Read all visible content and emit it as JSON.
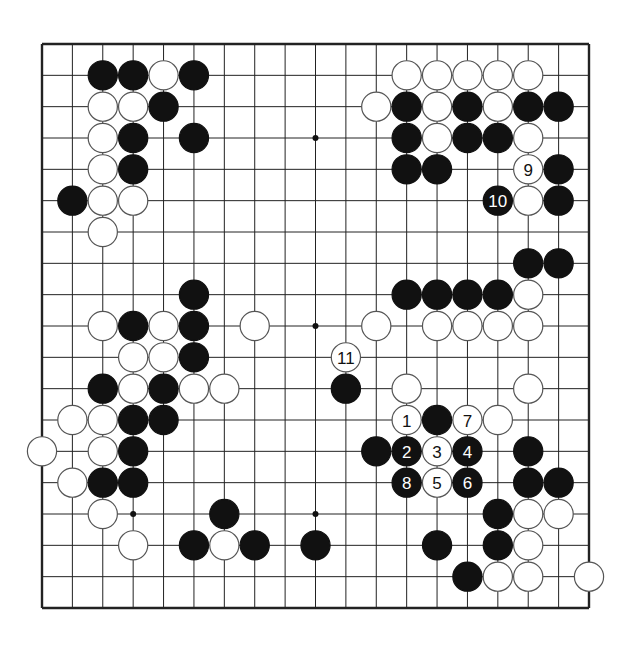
{
  "diagram": {
    "type": "go-board",
    "size": 19,
    "colors": {
      "line": "#222222",
      "black": "#111111",
      "white": "#ffffff",
      "background": "#ffffff"
    },
    "star_points": [
      [
        3,
        3
      ],
      [
        9,
        3
      ],
      [
        15,
        3
      ],
      [
        3,
        9
      ],
      [
        9,
        9
      ],
      [
        15,
        9
      ],
      [
        3,
        15
      ],
      [
        9,
        15
      ],
      [
        15,
        15
      ]
    ],
    "stones": [
      {
        "c": "B",
        "x": 2,
        "y": 1
      },
      {
        "c": "B",
        "x": 3,
        "y": 1
      },
      {
        "c": "W",
        "x": 4,
        "y": 1
      },
      {
        "c": "B",
        "x": 5,
        "y": 1
      },
      {
        "c": "W",
        "x": 2,
        "y": 2
      },
      {
        "c": "W",
        "x": 3,
        "y": 2
      },
      {
        "c": "B",
        "x": 4,
        "y": 2
      },
      {
        "c": "W",
        "x": 2,
        "y": 3
      },
      {
        "c": "B",
        "x": 3,
        "y": 3
      },
      {
        "c": "B",
        "x": 5,
        "y": 3
      },
      {
        "c": "W",
        "x": 2,
        "y": 4
      },
      {
        "c": "B",
        "x": 3,
        "y": 4
      },
      {
        "c": "B",
        "x": 1,
        "y": 5
      },
      {
        "c": "W",
        "x": 2,
        "y": 5
      },
      {
        "c": "W",
        "x": 3,
        "y": 5
      },
      {
        "c": "W",
        "x": 2,
        "y": 6
      },
      {
        "c": "W",
        "x": 12,
        "y": 1
      },
      {
        "c": "W",
        "x": 13,
        "y": 1
      },
      {
        "c": "W",
        "x": 14,
        "y": 1
      },
      {
        "c": "W",
        "x": 15,
        "y": 1
      },
      {
        "c": "W",
        "x": 16,
        "y": 1
      },
      {
        "c": "W",
        "x": 11,
        "y": 2
      },
      {
        "c": "B",
        "x": 12,
        "y": 2
      },
      {
        "c": "W",
        "x": 13,
        "y": 2
      },
      {
        "c": "B",
        "x": 14,
        "y": 2
      },
      {
        "c": "W",
        "x": 15,
        "y": 2
      },
      {
        "c": "B",
        "x": 16,
        "y": 2
      },
      {
        "c": "B",
        "x": 17,
        "y": 2
      },
      {
        "c": "B",
        "x": 12,
        "y": 3
      },
      {
        "c": "W",
        "x": 13,
        "y": 3
      },
      {
        "c": "B",
        "x": 14,
        "y": 3
      },
      {
        "c": "B",
        "x": 15,
        "y": 3
      },
      {
        "c": "W",
        "x": 16,
        "y": 3
      },
      {
        "c": "B",
        "x": 12,
        "y": 4
      },
      {
        "c": "B",
        "x": 13,
        "y": 4
      },
      {
        "c": "W",
        "x": 16,
        "y": 4,
        "n": "9"
      },
      {
        "c": "B",
        "x": 17,
        "y": 4
      },
      {
        "c": "B",
        "x": 15,
        "y": 5,
        "n": "10"
      },
      {
        "c": "W",
        "x": 16,
        "y": 5
      },
      {
        "c": "B",
        "x": 17,
        "y": 5
      },
      {
        "c": "B",
        "x": 16,
        "y": 7
      },
      {
        "c": "B",
        "x": 17,
        "y": 7
      },
      {
        "c": "B",
        "x": 5,
        "y": 8
      },
      {
        "c": "B",
        "x": 12,
        "y": 8
      },
      {
        "c": "B",
        "x": 13,
        "y": 8
      },
      {
        "c": "B",
        "x": 14,
        "y": 8
      },
      {
        "c": "B",
        "x": 15,
        "y": 8
      },
      {
        "c": "W",
        "x": 16,
        "y": 8
      },
      {
        "c": "W",
        "x": 2,
        "y": 9
      },
      {
        "c": "B",
        "x": 3,
        "y": 9
      },
      {
        "c": "W",
        "x": 4,
        "y": 9
      },
      {
        "c": "B",
        "x": 5,
        "y": 9
      },
      {
        "c": "W",
        "x": 7,
        "y": 9
      },
      {
        "c": "W",
        "x": 11,
        "y": 9
      },
      {
        "c": "W",
        "x": 13,
        "y": 9
      },
      {
        "c": "W",
        "x": 14,
        "y": 9
      },
      {
        "c": "W",
        "x": 15,
        "y": 9
      },
      {
        "c": "W",
        "x": 16,
        "y": 9
      },
      {
        "c": "W",
        "x": 3,
        "y": 10
      },
      {
        "c": "W",
        "x": 4,
        "y": 10
      },
      {
        "c": "B",
        "x": 5,
        "y": 10
      },
      {
        "c": "W",
        "x": 10,
        "y": 10,
        "n": "11"
      },
      {
        "c": "B",
        "x": 2,
        "y": 11
      },
      {
        "c": "W",
        "x": 3,
        "y": 11
      },
      {
        "c": "B",
        "x": 4,
        "y": 11
      },
      {
        "c": "W",
        "x": 5,
        "y": 11
      },
      {
        "c": "W",
        "x": 6,
        "y": 11
      },
      {
        "c": "B",
        "x": 10,
        "y": 11
      },
      {
        "c": "W",
        "x": 12,
        "y": 11
      },
      {
        "c": "W",
        "x": 16,
        "y": 11
      },
      {
        "c": "W",
        "x": 1,
        "y": 12
      },
      {
        "c": "W",
        "x": 2,
        "y": 12
      },
      {
        "c": "B",
        "x": 3,
        "y": 12
      },
      {
        "c": "B",
        "x": 4,
        "y": 12
      },
      {
        "c": "W",
        "x": 12,
        "y": 12,
        "n": "1"
      },
      {
        "c": "B",
        "x": 13,
        "y": 12
      },
      {
        "c": "W",
        "x": 14,
        "y": 12,
        "n": "7"
      },
      {
        "c": "W",
        "x": 15,
        "y": 12
      },
      {
        "c": "W",
        "x": 0,
        "y": 13
      },
      {
        "c": "W",
        "x": 2,
        "y": 13
      },
      {
        "c": "B",
        "x": 3,
        "y": 13
      },
      {
        "c": "B",
        "x": 11,
        "y": 13
      },
      {
        "c": "B",
        "x": 12,
        "y": 13,
        "n": "2"
      },
      {
        "c": "W",
        "x": 13,
        "y": 13,
        "n": "3"
      },
      {
        "c": "B",
        "x": 14,
        "y": 13,
        "n": "4"
      },
      {
        "c": "B",
        "x": 16,
        "y": 13
      },
      {
        "c": "W",
        "x": 1,
        "y": 14
      },
      {
        "c": "B",
        "x": 2,
        "y": 14
      },
      {
        "c": "B",
        "x": 3,
        "y": 14
      },
      {
        "c": "B",
        "x": 12,
        "y": 14,
        "n": "8"
      },
      {
        "c": "W",
        "x": 13,
        "y": 14,
        "n": "5"
      },
      {
        "c": "B",
        "x": 14,
        "y": 14,
        "n": "6"
      },
      {
        "c": "B",
        "x": 16,
        "y": 14
      },
      {
        "c": "B",
        "x": 17,
        "y": 14
      },
      {
        "c": "W",
        "x": 2,
        "y": 15
      },
      {
        "c": "B",
        "x": 6,
        "y": 15
      },
      {
        "c": "B",
        "x": 15,
        "y": 15
      },
      {
        "c": "W",
        "x": 16,
        "y": 15
      },
      {
        "c": "W",
        "x": 17,
        "y": 15
      },
      {
        "c": "W",
        "x": 3,
        "y": 16
      },
      {
        "c": "B",
        "x": 5,
        "y": 16
      },
      {
        "c": "W",
        "x": 6,
        "y": 16
      },
      {
        "c": "B",
        "x": 7,
        "y": 16
      },
      {
        "c": "B",
        "x": 9,
        "y": 16
      },
      {
        "c": "B",
        "x": 13,
        "y": 16
      },
      {
        "c": "B",
        "x": 15,
        "y": 16
      },
      {
        "c": "W",
        "x": 16,
        "y": 16
      },
      {
        "c": "B",
        "x": 14,
        "y": 17
      },
      {
        "c": "W",
        "x": 15,
        "y": 17
      },
      {
        "c": "W",
        "x": 16,
        "y": 17
      },
      {
        "c": "W",
        "x": 18,
        "y": 17
      }
    ],
    "move_labels": [
      "1",
      "2",
      "3",
      "4",
      "5",
      "6",
      "7",
      "8",
      "9",
      "10",
      "11"
    ]
  }
}
